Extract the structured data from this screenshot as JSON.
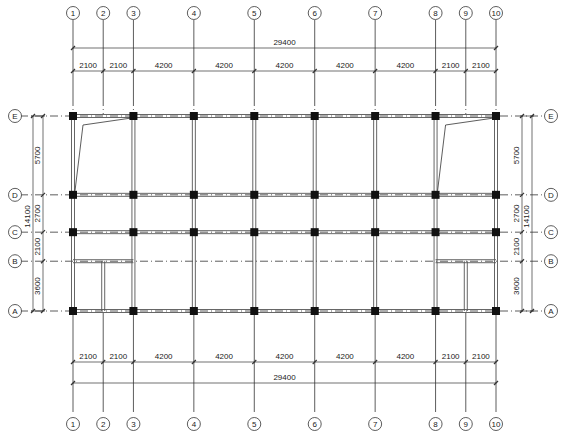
{
  "drawing": {
    "type": "structural-plan",
    "x_axes": [
      "1",
      "2",
      "3",
      "4",
      "5",
      "6",
      "7",
      "8",
      "9",
      "10"
    ],
    "x_spacings": [
      2100,
      2100,
      4200,
      4200,
      4200,
      4200,
      4200,
      2100,
      2100
    ],
    "x_total": "29400",
    "y_axes": [
      "A",
      "B",
      "C",
      "D",
      "E"
    ],
    "y_spacings": [
      3600,
      2100,
      2700,
      5700
    ],
    "y_total": "14100",
    "x_spacing_labels": [
      "2100",
      "2100",
      "4200",
      "4200",
      "4200",
      "4200",
      "4200",
      "2100",
      "2100"
    ],
    "y_spacing_labels": [
      "3600",
      "2100",
      "2700",
      "5700"
    ],
    "colors": {
      "line": "#333333",
      "column": "#111111",
      "beam": "#555555"
    }
  }
}
